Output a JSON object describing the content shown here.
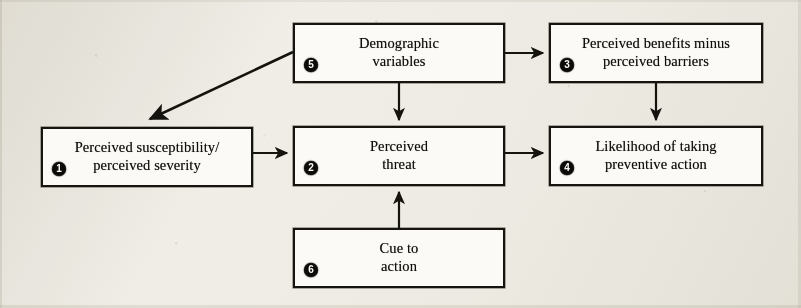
{
  "diagram": {
    "background_color": "#f1efe9",
    "box_fill": "#fbfaf6",
    "ink_color": "#16140f",
    "badge_color": "#0d0b08",
    "nodes": [
      {
        "id": "perceived-susceptibility",
        "badge": "1",
        "label": "Perceived susceptibility/\nperceived severity",
        "x": 41,
        "y": 127,
        "w": 212,
        "h": 60
      },
      {
        "id": "perceived-threat",
        "badge": "2",
        "label": "Perceived\nthreat",
        "x": 293,
        "y": 126,
        "w": 212,
        "h": 60
      },
      {
        "id": "perceived-benefits-minus-barriers",
        "badge": "3",
        "label": "Perceived benefits minus\nperceived barriers",
        "x": 549,
        "y": 23,
        "w": 214,
        "h": 60
      },
      {
        "id": "likelihood-of-taking-preventive-action",
        "badge": "4",
        "label": "Likelihood of taking\npreventive action",
        "x": 549,
        "y": 126,
        "w": 214,
        "h": 60
      },
      {
        "id": "demographic-variables",
        "badge": "5",
        "label": "Demographic\nvariables",
        "x": 293,
        "y": 23,
        "w": 212,
        "h": 60
      },
      {
        "id": "cue-to-action",
        "badge": "6",
        "label": "Cue to\naction",
        "x": 293,
        "y": 228,
        "w": 212,
        "h": 60
      }
    ],
    "arrows": [
      {
        "id": "demographic-to-benefits",
        "from": "demographic-variables",
        "to": "perceived-benefits-minus-barriers",
        "direction": "right"
      },
      {
        "id": "demographic-to-susceptibility",
        "from": "demographic-variables",
        "to": "perceived-susceptibility",
        "direction": "diagonal-down-left"
      },
      {
        "id": "demographic-to-threat",
        "from": "demographic-variables",
        "to": "perceived-threat",
        "direction": "down"
      },
      {
        "id": "susceptibility-to-threat",
        "from": "perceived-susceptibility",
        "to": "perceived-threat",
        "direction": "right"
      },
      {
        "id": "threat-to-likelihood",
        "from": "perceived-threat",
        "to": "likelihood-of-taking-preventive-action",
        "direction": "right"
      },
      {
        "id": "benefits-to-likelihood",
        "from": "perceived-benefits-minus-barriers",
        "to": "likelihood-of-taking-preventive-action",
        "direction": "down"
      },
      {
        "id": "cue-to-threat",
        "from": "cue-to-action",
        "to": "perceived-threat",
        "direction": "up"
      }
    ]
  }
}
